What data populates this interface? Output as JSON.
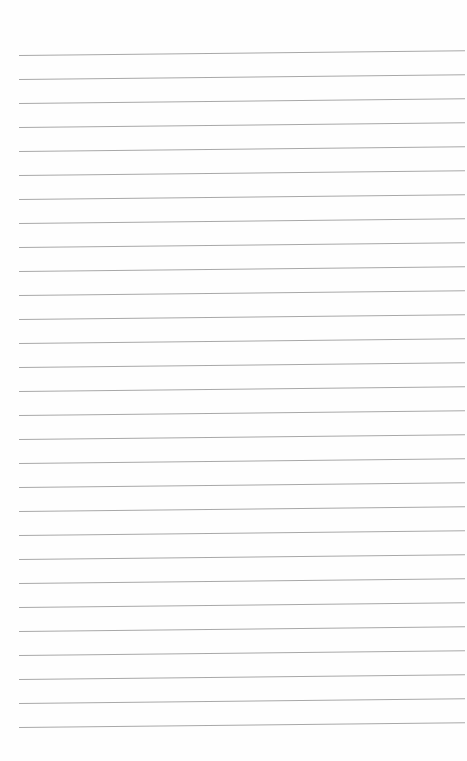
{
  "page": {
    "type": "lined-paper",
    "background": "#fefefe",
    "line_color": "#a8a8a8",
    "line_count": 29,
    "first_line_y": 55,
    "line_spacing": 24.0,
    "line_left": 19,
    "line_width": 446
  }
}
